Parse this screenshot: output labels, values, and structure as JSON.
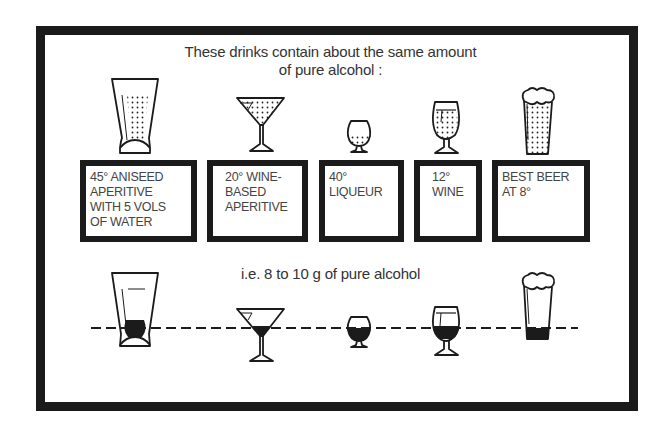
{
  "heading": {
    "line1": "These drinks contain about the same amount",
    "line2": "of pure alcohol :"
  },
  "drinks": [
    {
      "id": "aniseed",
      "glass": "tall-flared-tumbler-icon",
      "label_lines": [
        "45° ANISEED",
        "APERITIVE",
        "WITH 5 VOLS",
        "OF WATER"
      ]
    },
    {
      "id": "wine-aperitive",
      "glass": "cocktail-glass-icon",
      "label_lines": [
        "20° WINE-",
        "BASED",
        "APERITIVE"
      ]
    },
    {
      "id": "liqueur",
      "glass": "snifter-glass-icon",
      "label_lines": [
        "40°",
        "LIQUEUR"
      ]
    },
    {
      "id": "wine",
      "glass": "wine-glass-icon",
      "label_lines": [
        "12°",
        "WINE"
      ]
    },
    {
      "id": "beer",
      "glass": "beer-glass-icon",
      "label_lines": [
        "BEST BEER",
        "AT 8°"
      ]
    }
  ],
  "comparison": {
    "caption": "i.e. 8 to 10 g of pure alcohol",
    "reference_line": "dashed"
  },
  "colors": {
    "ink": "#1b1b1b",
    "background": "#ffffff"
  }
}
